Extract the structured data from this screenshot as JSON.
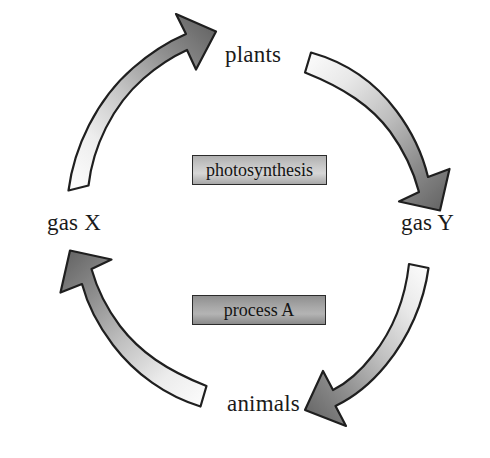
{
  "diagram": {
    "type": "cycle-diagram",
    "background_color": "#ffffff",
    "node_labels": {
      "top": "plants",
      "right": "gas Y",
      "bottom": "animals",
      "left": "gas X"
    },
    "process_boxes": [
      {
        "id": "photosynthesis",
        "label": "photosynthesis",
        "position": "upper-center",
        "fill_light": "#d6d6d6",
        "fill_dark": "#a8a8a8",
        "border_color": "#2b2b2b"
      },
      {
        "id": "process-a",
        "label": "process A",
        "position": "lower-center",
        "fill_light": "#b4b4b4",
        "fill_dark": "#8a8a8a",
        "border_color": "#2b2b2b"
      }
    ],
    "arrows": [
      {
        "id": "arrow-gasx-to-plants",
        "from": "gas X",
        "to": "plants",
        "quadrant": "top-left",
        "direction": "clockwise",
        "tail_color": "#f7f7f7",
        "head_color": "#686868",
        "outline_color": "#1f1f1f"
      },
      {
        "id": "arrow-plants-to-gasy",
        "from": "plants",
        "to": "gas Y",
        "quadrant": "top-right",
        "direction": "clockwise",
        "tail_color": "#f7f7f7",
        "head_color": "#686868",
        "outline_color": "#1f1f1f"
      },
      {
        "id": "arrow-gasy-to-animals",
        "from": "gas Y",
        "to": "animals",
        "quadrant": "bottom-right",
        "direction": "clockwise",
        "tail_color": "#f7f7f7",
        "head_color": "#686868",
        "outline_color": "#1f1f1f"
      },
      {
        "id": "arrow-animals-to-gasx",
        "from": "animals",
        "to": "gas X",
        "quadrant": "bottom-left",
        "direction": "clockwise",
        "tail_color": "#f7f7f7",
        "head_color": "#686868",
        "outline_color": "#1f1f1f"
      }
    ]
  }
}
